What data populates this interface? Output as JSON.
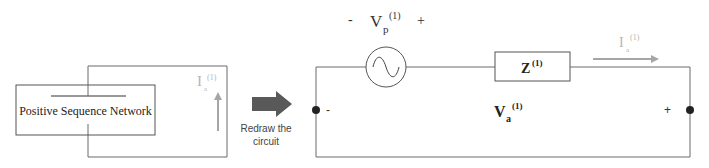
{
  "left_diagram": {
    "network_label": "Positive Sequence Network",
    "current_label": {
      "base": "I",
      "sub": "a",
      "sup": "(1)"
    }
  },
  "transition": {
    "line1": "Redraw the",
    "line2": "circuit",
    "arrow_color": "#595959"
  },
  "right_circuit": {
    "source_label": {
      "base": "V",
      "sub": "p",
      "sup": "(1)",
      "minus": "-",
      "plus": "+"
    },
    "impedance_label": {
      "base": "Z",
      "sup": "(1)"
    },
    "current_label": {
      "base": "I",
      "sub": "a",
      "sup": "(1)"
    },
    "terminal_voltage": {
      "base": "V",
      "sub": "a",
      "sup": "(1)"
    },
    "terminal_minus": "-",
    "terminal_plus": "+"
  },
  "colors": {
    "wire": "#6b6b6b",
    "box_border": "#555555",
    "current_arrow": "#a6a6a6",
    "node": "#222222",
    "text": "#222222"
  }
}
